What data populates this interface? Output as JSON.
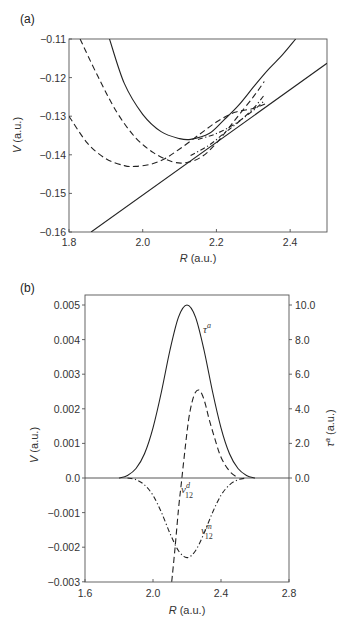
{
  "chart_data": [
    {
      "panel": "(a)",
      "type": "line",
      "title": "",
      "xlabel": "R (a.u.)",
      "ylabel": "V (a.u.)",
      "xlim": [
        1.8,
        2.5
      ],
      "ylim": [
        -0.16,
        -0.11
      ],
      "xticks": [
        1.8,
        2.0,
        2.2,
        2.4
      ],
      "xtick_labels": [
        "1.8",
        "2.0",
        "2.2",
        "2.4"
      ],
      "yticks": [
        -0.11,
        -0.12,
        -0.13,
        -0.14,
        -0.15,
        -0.16
      ],
      "ytick_labels": [
        "−0.11",
        "−0.12",
        "−0.13",
        "−0.14",
        "−0.15",
        "−0.16"
      ],
      "grid": false,
      "series": [
        {
          "name": "upper adiabatic",
          "style": "solid",
          "x": [
            1.91,
            1.95,
            2.0,
            2.05,
            2.1,
            2.13,
            2.18,
            2.22,
            2.26,
            2.3,
            2.34,
            2.38,
            2.415
          ],
          "y": [
            -0.11,
            -0.1215,
            -0.1295,
            -0.134,
            -0.1358,
            -0.136,
            -0.1345,
            -0.131,
            -0.1272,
            -0.1225,
            -0.118,
            -0.114,
            -0.11
          ]
        },
        {
          "name": "diabatic 1",
          "style": "dashed",
          "x": [
            1.83,
            1.88,
            1.93,
            1.98,
            2.03,
            2.08,
            2.12,
            2.16,
            2.2,
            2.25,
            2.3,
            2.33
          ],
          "y": [
            -0.11,
            -0.12,
            -0.129,
            -0.1355,
            -0.1395,
            -0.1418,
            -0.142,
            -0.1405,
            -0.137,
            -0.131,
            -0.125,
            -0.121
          ]
        },
        {
          "name": "diabatic 2",
          "style": "dashed",
          "x": [
            1.8,
            1.85,
            1.9,
            1.95,
            1.98,
            2.02,
            2.06,
            2.1,
            2.15,
            2.2,
            2.25,
            2.3,
            2.34
          ],
          "y": [
            -0.13,
            -0.137,
            -0.141,
            -0.1428,
            -0.143,
            -0.1425,
            -0.141,
            -0.1385,
            -0.135,
            -0.1315,
            -0.129,
            -0.128,
            -0.1265
          ]
        },
        {
          "name": "dash-dot 1",
          "style": "dashdot",
          "x": [
            2.15,
            2.2,
            2.25,
            2.3,
            2.33
          ],
          "y": [
            -0.136,
            -0.1345,
            -0.132,
            -0.1285,
            -0.126
          ]
        },
        {
          "name": "dash-dot 2",
          "style": "dashdot",
          "x": [
            2.13,
            2.18,
            2.22,
            2.26,
            2.3,
            2.33
          ],
          "y": [
            -0.1402,
            -0.1375,
            -0.1345,
            -0.1315,
            -0.128,
            -0.1245
          ]
        },
        {
          "name": "lower adiabatic",
          "style": "solid",
          "x": [
            1.86,
            2.0,
            2.1,
            2.2,
            2.3,
            2.4,
            2.5
          ],
          "y": [
            -0.16,
            -0.1505,
            -0.144,
            -0.1372,
            -0.13,
            -0.1232,
            -0.1163
          ]
        }
      ]
    },
    {
      "panel": "(b)",
      "type": "line",
      "title": "",
      "xlabel": "R (a.u.)",
      "ylabel": "V (a.u.)",
      "ylabel_right": "τᵃ (a.u.)",
      "xlim": [
        1.6,
        2.8
      ],
      "ylim": [
        -0.003,
        0.0053
      ],
      "ylim_right": [
        -6.0,
        10.6
      ],
      "xticks": [
        1.6,
        2.0,
        2.4,
        2.8
      ],
      "xtick_labels": [
        "1.6",
        "2.0",
        "2.4",
        "2.8"
      ],
      "yticks": [
        0.005,
        0.004,
        0.003,
        0.002,
        0.001,
        0.0,
        -0.001,
        -0.002,
        -0.003
      ],
      "ytick_labels": [
        "0.005",
        "0.004",
        "0.003",
        "0.002",
        "0.001",
        "0.0",
        "−0.001",
        "−0.002",
        "−0.003"
      ],
      "yticks_right": [
        10.0,
        8.0,
        6.0,
        4.0,
        2.0,
        0.0
      ],
      "ytick_labels_right": [
        "10.0",
        "8.0",
        "6.0",
        "4.0",
        "2.0",
        "0.0"
      ],
      "grid": false,
      "series": [
        {
          "name": "τ^a",
          "axis": "right",
          "style": "solid",
          "x": [
            1.8,
            1.85,
            1.9,
            1.95,
            2.0,
            2.05,
            2.1,
            2.15,
            2.2,
            2.25,
            2.3,
            2.35,
            2.4,
            2.45,
            2.5,
            2.55,
            2.6
          ],
          "y": [
            0.0,
            0.15,
            0.55,
            1.4,
            2.9,
            5.0,
            7.4,
            9.3,
            10.0,
            9.3,
            7.4,
            5.0,
            2.9,
            1.4,
            0.55,
            0.15,
            0.0
          ]
        },
        {
          "name": "v12^d",
          "axis": "left",
          "style": "dashed",
          "x": [
            2.11,
            2.13,
            2.15,
            2.17,
            2.19,
            2.21,
            2.23,
            2.25,
            2.27,
            2.29,
            2.31,
            2.33,
            2.36,
            2.4,
            2.45,
            2.5
          ],
          "y": [
            -0.003,
            -0.002,
            -0.0009,
            0.0,
            0.0009,
            0.0017,
            0.0022,
            0.00248,
            0.00254,
            0.0024,
            0.0021,
            0.0017,
            0.0012,
            0.0006,
            0.0002,
            0.0
          ]
        },
        {
          "name": "v12^m",
          "axis": "left",
          "style": "dashdot",
          "x": [
            1.85,
            1.9,
            1.95,
            2.0,
            2.05,
            2.1,
            2.15,
            2.2,
            2.25,
            2.3,
            2.35,
            2.4,
            2.45,
            2.5,
            2.55
          ],
          "y": [
            0.0,
            -5e-05,
            -0.0002,
            -0.0005,
            -0.001,
            -0.0016,
            -0.0021,
            -0.0023,
            -0.0021,
            -0.0016,
            -0.001,
            -0.0005,
            -0.0002,
            -5e-05,
            0.0
          ]
        }
      ],
      "annotations": [
        {
          "text": "τ",
          "sup": "a",
          "x": 2.27,
          "y": 0.0043
        },
        {
          "text": "v",
          "sup": "d",
          "sub": "12",
          "x": 2.17,
          "y": -0.0003
        },
        {
          "text": "v",
          "sup": "m",
          "sub": "12",
          "x": 2.28,
          "y": -0.0017
        }
      ]
    }
  ],
  "labels": {
    "panel_a": "(a)",
    "panel_b": "(b)",
    "a_xlabel_var": "R",
    "a_xlabel_unit": " (a.u.)",
    "a_ylabel_var": "V",
    "a_ylabel_unit": " (a.u.)",
    "b_xlabel_var": "R",
    "b_xlabel_unit": " (a.u.)",
    "b_ylabel_var": "V",
    "b_ylabel_unit": " (a.u.)",
    "b_ylabel_right_var": "τ",
    "b_ylabel_right_sup": "a",
    "b_ylabel_right_unit": " (a.u.)",
    "tau_label": "τ",
    "tau_sup": "a",
    "vd_label": "v",
    "vd_sup": "d",
    "vd_sub": "12",
    "vm_label": "v",
    "vm_sup": "m",
    "vm_sub": "12"
  }
}
